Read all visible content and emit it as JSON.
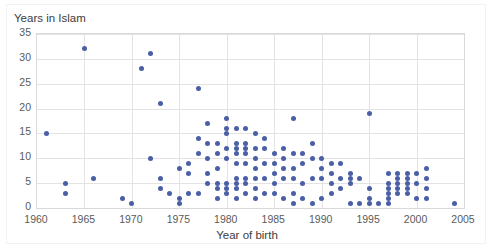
{
  "chart_data": {
    "type": "scatter",
    "title": "Years in Islam",
    "ylabel": "Years in Islam",
    "xlabel": "Year of birth",
    "xlim": [
      1960,
      2005
    ],
    "ylim": [
      0,
      35
    ],
    "xticks": [
      1960,
      1965,
      1970,
      1975,
      1980,
      1985,
      1990,
      1995,
      2000,
      2005
    ],
    "yticks": [
      0,
      5,
      10,
      15,
      20,
      25,
      30,
      35
    ],
    "grid": true,
    "legend": "none",
    "marker_color": "#4a5fa5",
    "points": [
      [
        1961,
        15
      ],
      [
        1963,
        5
      ],
      [
        1963,
        3
      ],
      [
        1965,
        32
      ],
      [
        1966,
        6
      ],
      [
        1969,
        2
      ],
      [
        1970,
        1
      ],
      [
        1971,
        28
      ],
      [
        1972,
        31
      ],
      [
        1972,
        10
      ],
      [
        1973,
        21
      ],
      [
        1973,
        6
      ],
      [
        1973,
        4
      ],
      [
        1974,
        3
      ],
      [
        1975,
        8
      ],
      [
        1975,
        2
      ],
      [
        1975,
        1
      ],
      [
        1976,
        9
      ],
      [
        1976,
        7
      ],
      [
        1976,
        3
      ],
      [
        1977,
        24
      ],
      [
        1977,
        14
      ],
      [
        1977,
        11
      ],
      [
        1977,
        3
      ],
      [
        1978,
        17
      ],
      [
        1978,
        13
      ],
      [
        1978,
        10
      ],
      [
        1978,
        7
      ],
      [
        1978,
        5
      ],
      [
        1979,
        13
      ],
      [
        1979,
        11
      ],
      [
        1979,
        8
      ],
      [
        1979,
        5
      ],
      [
        1979,
        4
      ],
      [
        1979,
        2
      ],
      [
        1980,
        18
      ],
      [
        1980,
        16
      ],
      [
        1980,
        15
      ],
      [
        1980,
        12
      ],
      [
        1980,
        10
      ],
      [
        1980,
        5
      ],
      [
        1980,
        4
      ],
      [
        1980,
        3
      ],
      [
        1981,
        16
      ],
      [
        1981,
        13
      ],
      [
        1981,
        12
      ],
      [
        1981,
        11
      ],
      [
        1981,
        9
      ],
      [
        1981,
        6
      ],
      [
        1981,
        5
      ],
      [
        1981,
        4
      ],
      [
        1981,
        2
      ],
      [
        1982,
        16
      ],
      [
        1982,
        13
      ],
      [
        1982,
        12
      ],
      [
        1982,
        11
      ],
      [
        1982,
        9
      ],
      [
        1982,
        6
      ],
      [
        1982,
        5
      ],
      [
        1982,
        3
      ],
      [
        1983,
        15
      ],
      [
        1983,
        12
      ],
      [
        1983,
        10
      ],
      [
        1983,
        8
      ],
      [
        1983,
        6
      ],
      [
        1983,
        4
      ],
      [
        1983,
        2
      ],
      [
        1984,
        14
      ],
      [
        1984,
        12
      ],
      [
        1984,
        9
      ],
      [
        1984,
        6
      ],
      [
        1984,
        3
      ],
      [
        1985,
        11
      ],
      [
        1985,
        9
      ],
      [
        1985,
        7
      ],
      [
        1985,
        5
      ],
      [
        1985,
        3
      ],
      [
        1986,
        12
      ],
      [
        1986,
        10
      ],
      [
        1986,
        8
      ],
      [
        1986,
        6
      ],
      [
        1986,
        2
      ],
      [
        1987,
        18
      ],
      [
        1987,
        11
      ],
      [
        1987,
        8
      ],
      [
        1987,
        6
      ],
      [
        1987,
        3
      ],
      [
        1987,
        1
      ],
      [
        1988,
        11
      ],
      [
        1988,
        9
      ],
      [
        1988,
        5
      ],
      [
        1988,
        2
      ],
      [
        1989,
        13
      ],
      [
        1989,
        10
      ],
      [
        1989,
        6
      ],
      [
        1989,
        1
      ],
      [
        1990,
        10
      ],
      [
        1990,
        8
      ],
      [
        1990,
        6
      ],
      [
        1990,
        2
      ],
      [
        1991,
        9
      ],
      [
        1991,
        7
      ],
      [
        1991,
        5
      ],
      [
        1991,
        3
      ],
      [
        1992,
        9
      ],
      [
        1992,
        6
      ],
      [
        1992,
        4
      ],
      [
        1993,
        7
      ],
      [
        1993,
        6
      ],
      [
        1993,
        5
      ],
      [
        1993,
        1
      ],
      [
        1994,
        6
      ],
      [
        1994,
        1
      ],
      [
        1995,
        19
      ],
      [
        1995,
        4
      ],
      [
        1995,
        2
      ],
      [
        1995,
        1
      ],
      [
        1996,
        1
      ],
      [
        1997,
        7
      ],
      [
        1997,
        5
      ],
      [
        1997,
        4
      ],
      [
        1997,
        3
      ],
      [
        1997,
        2
      ],
      [
        1997,
        1
      ],
      [
        1998,
        7
      ],
      [
        1998,
        6
      ],
      [
        1998,
        5
      ],
      [
        1998,
        4
      ],
      [
        1998,
        3
      ],
      [
        1999,
        7
      ],
      [
        1999,
        6
      ],
      [
        1999,
        5
      ],
      [
        1999,
        4
      ],
      [
        1999,
        3
      ],
      [
        2000,
        7
      ],
      [
        2000,
        5
      ],
      [
        2000,
        2
      ],
      [
        2001,
        8
      ],
      [
        2001,
        6
      ],
      [
        2001,
        4
      ],
      [
        2001,
        2
      ],
      [
        2004,
        1
      ]
    ]
  }
}
